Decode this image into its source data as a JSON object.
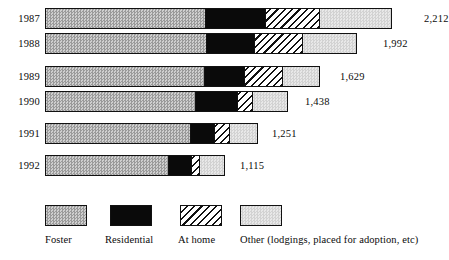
{
  "chart_data": {
    "type": "bar",
    "subtype": "stacked-horizontal-bar",
    "title": "",
    "subtitle": "",
    "xlabel": "",
    "ylabel": "",
    "grid": false,
    "legend_position": "bottom",
    "categories": [
      "1987",
      "1988",
      "1989",
      "1990",
      "1991",
      "1992"
    ],
    "series": [
      {
        "name": "Foster",
        "values": [
          1020,
          1027,
          1013,
          956,
          924,
          784
        ]
      },
      {
        "name": "Residential",
        "values": [
          382,
          306,
          255,
          274,
          159,
          153
        ]
      },
      {
        "name": "At home",
        "values": [
          350,
          312,
          249,
          96,
          96,
          51
        ]
      },
      {
        "name": "Other (lodgings, placed for adoption, etc)",
        "values": [
          460,
          347,
          112,
          112,
          72,
          127
        ]
      }
    ],
    "totals": [
      2212,
      1992,
      1629,
      1438,
      1251,
      1115
    ],
    "total_labels": [
      "2,212",
      "1,992",
      "1,629",
      "1,438",
      "1,251",
      "1,115"
    ],
    "xlim": [
      0,
      2212
    ],
    "colors": {
      "Foster": "#b4b4b4",
      "Residential": "#0a0a0a",
      "At home": "#ffffff",
      "Other (lodgings, placed for adoption, etc)": "#dcdcdc",
      "outline": "#111111"
    },
    "patterns": {
      "Foster": "fine-stipple-medium-gray",
      "Residential": "solid-black",
      "At home": "diagonal-hatch",
      "Other (lodgings, placed for adoption, etc)": "fine-stipple-light-gray"
    }
  },
  "rows": [
    {
      "year": "1987",
      "total_label": "2,212",
      "row_top": 8,
      "bar_width": 347,
      "label_left": 424,
      "segments": [
        {
          "key": "foster",
          "width": 160
        },
        {
          "key": "residential",
          "width": 60
        },
        {
          "key": "athome",
          "width": 55
        },
        {
          "key": "other",
          "width": 72
        }
      ]
    },
    {
      "year": "1988",
      "total_label": "1,992",
      "row_top": 33,
      "bar_width": 312,
      "label_left": 383,
      "segments": [
        {
          "key": "foster",
          "width": 161
        },
        {
          "key": "residential",
          "width": 48
        },
        {
          "key": "athome",
          "width": 49
        },
        {
          "key": "other",
          "width": 54
        }
      ]
    },
    {
      "year": "1989",
      "total_label": "1,629",
      "row_top": 66,
      "bar_width": 275,
      "label_left": 340,
      "segments": [
        {
          "key": "foster",
          "width": 159
        },
        {
          "key": "residential",
          "width": 40
        },
        {
          "key": "athome",
          "width": 39
        },
        {
          "key": "other",
          "width": 37
        }
      ]
    },
    {
      "year": "1990",
      "total_label": "1,438",
      "row_top": 91,
      "bar_width": 243,
      "label_left": 305,
      "segments": [
        {
          "key": "foster",
          "width": 150
        },
        {
          "key": "residential",
          "width": 43
        },
        {
          "key": "athome",
          "width": 15
        },
        {
          "key": "other",
          "width": 35
        }
      ]
    },
    {
      "year": "1991",
      "total_label": "1,251",
      "row_top": 123,
      "bar_width": 213,
      "label_left": 272,
      "segments": [
        {
          "key": "foster",
          "width": 145
        },
        {
          "key": "residential",
          "width": 25
        },
        {
          "key": "athome",
          "width": 15
        },
        {
          "key": "other",
          "width": 28
        }
      ]
    },
    {
      "year": "1992",
      "total_label": "1,115",
      "row_top": 155,
      "bar_width": 180,
      "label_left": 240,
      "segments": [
        {
          "key": "foster",
          "width": 123
        },
        {
          "key": "residential",
          "width": 24
        },
        {
          "key": "athome",
          "width": 8
        },
        {
          "key": "other",
          "width": 25
        }
      ]
    }
  ],
  "legend": {
    "items": [
      {
        "key": "foster",
        "label": "Foster",
        "left": 45,
        "text_left": 45
      },
      {
        "key": "residential",
        "label": "Residential",
        "left": 110,
        "text_left": 105
      },
      {
        "key": "athome",
        "label": "At home",
        "left": 180,
        "text_left": 178
      },
      {
        "key": "other",
        "label": "Other (lodgings, placed for adoption, etc)",
        "left": 240,
        "text_left": 240
      }
    ]
  }
}
